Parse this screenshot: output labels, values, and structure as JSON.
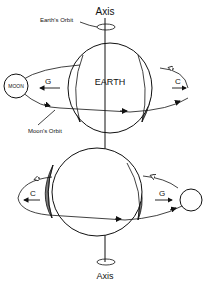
{
  "top": {
    "axis_label": "Axis",
    "orbit_label": "Earth's Orbit",
    "earth_label": "EARTH",
    "moon_label": "MOON",
    "left_arrow_label": "G",
    "right_arrow_label": "C",
    "moon_orbit_label": "Moon's Orbit"
  },
  "bottom": {
    "left_arrow_label": "C",
    "right_arrow_label": "G",
    "axis_label": "Axis"
  },
  "colors": {
    "line": "#111111",
    "bulge": "#7a7a7a"
  }
}
